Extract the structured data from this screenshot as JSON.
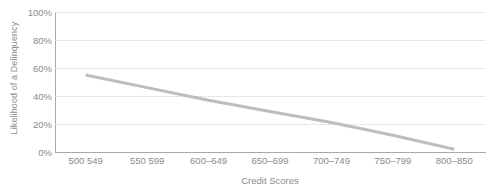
{
  "chart_data": {
    "type": "line",
    "title": "",
    "subtitle": "",
    "xlabel": "Credit Scores",
    "ylabel": "Likelihood of a Delinquency",
    "categories": [
      "500 549",
      "550 599",
      "600–649",
      "650–699",
      "700–749",
      "750–799",
      "800–850"
    ],
    "series": [
      {
        "name": "Likelihood of a Delinquency",
        "values": [
          55,
          46,
          37,
          29,
          21,
          12,
          2
        ],
        "color": "#bdbdbd"
      }
    ],
    "ylim": [
      0,
      100
    ],
    "ytick_values": [
      0,
      20,
      40,
      60,
      80,
      100
    ],
    "ytick_labels": [
      "0%",
      "20%",
      "40%",
      "60%",
      "80%",
      "100%"
    ],
    "grid": {
      "horizontal": true,
      "vertical": false,
      "style": "dotted",
      "color": "#cfcfcf"
    },
    "legend": {
      "visible": false,
      "position": "none"
    },
    "axis_line_color": "#a9a9a9",
    "background_color": "#ffffff",
    "text_color": "#8a8a8a",
    "line_width": 3
  }
}
